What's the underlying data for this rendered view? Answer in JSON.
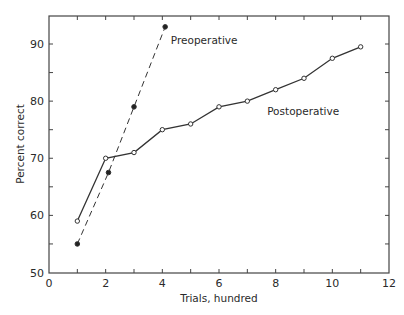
{
  "chart_data": {
    "type": "line",
    "title": "",
    "xlabel": "Trials, hundred",
    "ylabel": "Percent correct",
    "xlim": [
      0,
      12
    ],
    "ylim": [
      50,
      95
    ],
    "xticks": [
      0,
      2,
      4,
      6,
      8,
      10,
      12
    ],
    "yticks": [
      50,
      60,
      70,
      80,
      90
    ],
    "grid": false,
    "legend": "inline labels",
    "series": [
      {
        "name": "Preoperative",
        "style": "dashed",
        "marker": "filled-circle",
        "x": [
          1,
          2.1,
          3,
          4.1
        ],
        "y": [
          55,
          67.5,
          79,
          93
        ]
      },
      {
        "name": "Postoperative",
        "style": "solid",
        "marker": "open-circle",
        "x": [
          1,
          2,
          3,
          4,
          5,
          6,
          7,
          8,
          9,
          10,
          11
        ],
        "y": [
          59,
          70,
          71,
          75,
          76,
          79,
          80,
          82,
          84,
          87.5,
          89.5
        ]
      }
    ],
    "annotations": [
      {
        "text": "Preoperative",
        "x": 4.3,
        "y": 90
      },
      {
        "text": "Postoperative",
        "x": 7.7,
        "y": 77.5
      }
    ]
  }
}
